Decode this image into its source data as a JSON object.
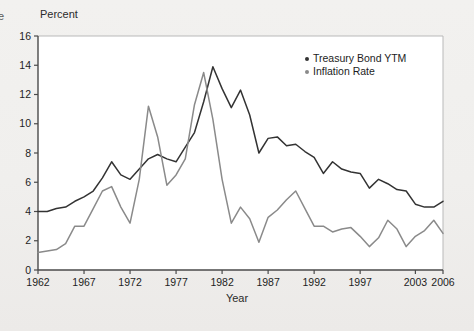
{
  "page": {
    "clipped_caption_fragment": "e"
  },
  "chart_data": {
    "type": "line",
    "title": "",
    "xlabel": "Year",
    "ylabel": "Percent",
    "ylim": [
      0,
      16
    ],
    "xlim": [
      1962,
      2006
    ],
    "yticks": [
      0,
      2,
      4,
      6,
      8,
      10,
      12,
      14,
      16
    ],
    "xticks": [
      1962,
      1967,
      1972,
      1977,
      1982,
      1987,
      1992,
      1997,
      2003,
      2006
    ],
    "grid": false,
    "legend_position": "upper right inside",
    "x": [
      1962,
      1963,
      1964,
      1965,
      1966,
      1967,
      1968,
      1969,
      1970,
      1971,
      1972,
      1973,
      1974,
      1975,
      1976,
      1977,
      1978,
      1979,
      1980,
      1981,
      1982,
      1983,
      1984,
      1985,
      1986,
      1987,
      1988,
      1989,
      1990,
      1991,
      1992,
      1993,
      1994,
      1995,
      1996,
      1997,
      1998,
      1999,
      2000,
      2001,
      2002,
      2003,
      2004,
      2005,
      2006
    ],
    "series": [
      {
        "name": "Treasury Bond YTM",
        "color": "#333333",
        "values": [
          4.0,
          4.0,
          4.2,
          4.3,
          4.7,
          5.0,
          5.4,
          6.3,
          7.4,
          6.5,
          6.2,
          6.9,
          7.6,
          7.9,
          7.6,
          7.4,
          8.4,
          9.4,
          11.5,
          13.9,
          12.4,
          11.1,
          12.3,
          10.6,
          8.0,
          9.0,
          9.1,
          8.5,
          8.6,
          8.1,
          7.7,
          6.6,
          7.4,
          6.9,
          6.7,
          6.6,
          5.6,
          6.2,
          5.9,
          5.5,
          5.4,
          4.5,
          4.3,
          4.3,
          4.7
        ]
      },
      {
        "name": "Inflation Rate",
        "color": "#8a8a8a",
        "values": [
          1.2,
          1.3,
          1.4,
          1.8,
          3.0,
          3.0,
          4.2,
          5.4,
          5.7,
          4.3,
          3.2,
          6.2,
          11.2,
          9.1,
          5.8,
          6.5,
          7.6,
          11.3,
          13.5,
          10.3,
          6.2,
          3.2,
          4.3,
          3.5,
          1.9,
          3.6,
          4.1,
          4.8,
          5.4,
          4.2,
          3.0,
          3.0,
          2.6,
          2.8,
          2.9,
          2.3,
          1.6,
          2.2,
          3.4,
          2.8,
          1.6,
          2.3,
          2.7,
          3.4,
          2.5
        ]
      }
    ]
  },
  "legend": {
    "items": [
      {
        "label": "Treasury Bond YTM",
        "color": "#333333"
      },
      {
        "label": "Inflation Rate",
        "color": "#8a8a8a"
      }
    ]
  }
}
